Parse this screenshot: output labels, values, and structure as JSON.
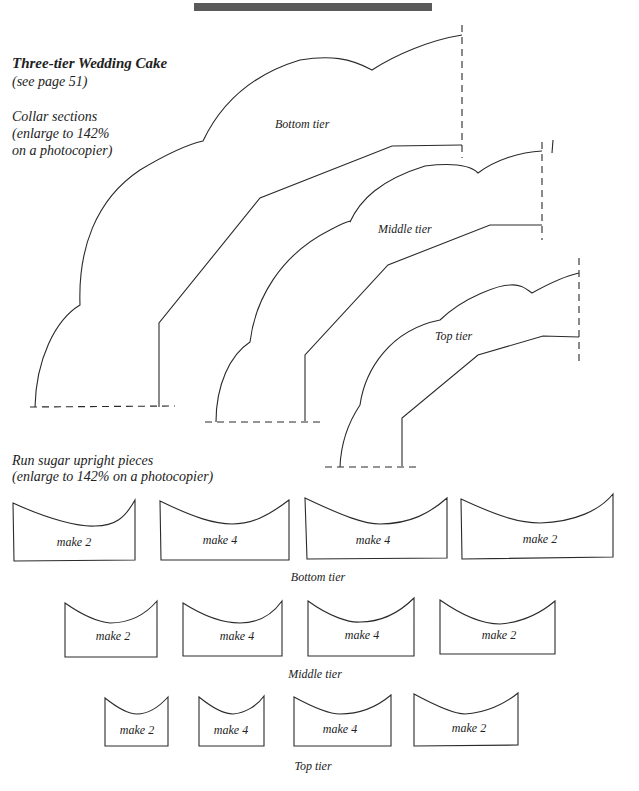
{
  "header": {
    "title": "Three-tier Wedding Cake",
    "page_ref": "(see page 51)"
  },
  "collar": {
    "heading_line1": "Collar sections",
    "heading_line2": "(enlarge to 142%",
    "heading_line3": "on a photocopier)",
    "tiers": [
      {
        "label": "Bottom tier"
      },
      {
        "label": "Middle tier"
      },
      {
        "label": "Top tier"
      }
    ]
  },
  "uprights": {
    "heading_line1": "Run sugar upright pieces",
    "heading_line2": "(enlarge to 142% on a photocopier)",
    "rows": [
      {
        "caption": "Bottom tier",
        "pieces": [
          {
            "label": "make 2"
          },
          {
            "label": "make 4"
          },
          {
            "label": "make 4"
          },
          {
            "label": "make 2"
          }
        ]
      },
      {
        "caption": "Middle tier",
        "pieces": [
          {
            "label": "make 2"
          },
          {
            "label": "make 4"
          },
          {
            "label": "make 4"
          },
          {
            "label": "make 2"
          }
        ]
      },
      {
        "caption": "Top tier",
        "pieces": [
          {
            "label": "make 2"
          },
          {
            "label": "make 4"
          },
          {
            "label": "make 4"
          },
          {
            "label": "make 2"
          }
        ]
      }
    ]
  }
}
